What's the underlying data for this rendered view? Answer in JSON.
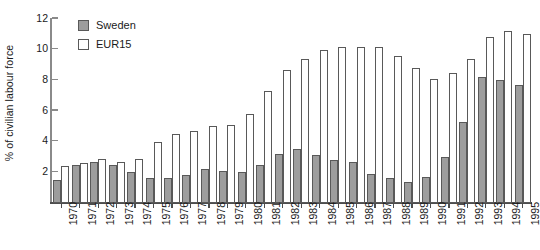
{
  "chart_data": {
    "type": "bar",
    "title": "",
    "xlabel": "",
    "ylabel": "% of civilian labour force",
    "ylim": [
      0,
      12
    ],
    "y_ticks": [
      2,
      4,
      6,
      8,
      10,
      12
    ],
    "grid": false,
    "legend_position": "top-left",
    "categories": [
      "1970",
      "1971",
      "1972",
      "1973",
      "1974",
      "1975",
      "1976",
      "1977",
      "1978",
      "1979",
      "1980",
      "1981",
      "1982",
      "1983",
      "1984",
      "1985",
      "1986",
      "1987",
      "1988",
      "1989",
      "1990",
      "1991",
      "1992",
      "1993",
      "1994",
      "1995"
    ],
    "series": [
      {
        "name": "Sweden",
        "color": "#9d9d9d",
        "values": [
          1.5,
          2.5,
          2.7,
          2.5,
          2.0,
          1.6,
          1.6,
          1.8,
          2.2,
          2.1,
          2.0,
          2.5,
          3.2,
          3.5,
          3.1,
          2.8,
          2.7,
          1.9,
          1.6,
          1.4,
          1.7,
          3.0,
          5.3,
          8.2,
          8.0,
          7.7
        ]
      },
      {
        "name": "EUR15",
        "color": "#ffffff",
        "values": [
          2.4,
          2.6,
          2.9,
          2.7,
          2.9,
          4.0,
          4.5,
          4.7,
          5.0,
          5.1,
          5.8,
          7.3,
          8.7,
          9.4,
          10.0,
          10.2,
          10.2,
          10.2,
          9.6,
          8.8,
          8.1,
          8.5,
          9.4,
          10.8,
          11.2,
          11.0
        ]
      }
    ]
  },
  "legend": {
    "items": [
      {
        "label": "Sweden",
        "swatch": "filled-gray"
      },
      {
        "label": "EUR15",
        "swatch": "empty-white"
      }
    ]
  },
  "axis": {
    "y_title": "% of civilian labour force"
  }
}
